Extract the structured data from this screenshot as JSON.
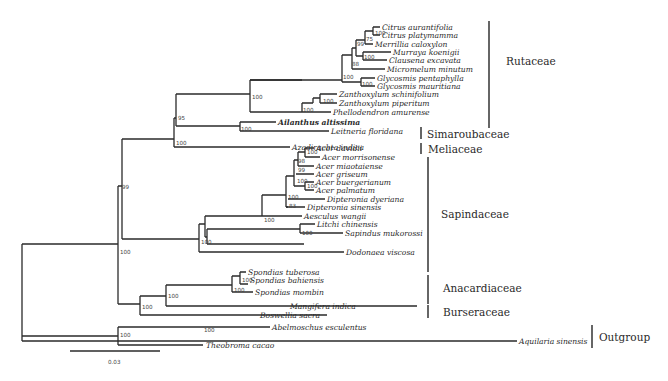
{
  "figure": {
    "type": "phylogenetic-tree",
    "scale_bar": {
      "label": "0.03"
    }
  },
  "taxa": [
    {
      "name": "Citrus aurantifolia",
      "y": 27,
      "x": 382
    },
    {
      "name": "Citrus platymamma",
      "y": 35,
      "x": 382
    },
    {
      "name": "Merrillia caloxylon",
      "y": 44,
      "x": 375
    },
    {
      "name": "Murraya koenigii",
      "y": 52,
      "x": 393
    },
    {
      "name": "Clausena excavata",
      "y": 60,
      "x": 389
    },
    {
      "name": "Micromelum minutum",
      "y": 69,
      "x": 387
    },
    {
      "name": "Glycosmis pentaphylla",
      "y": 78,
      "x": 377
    },
    {
      "name": "Glycosmis mauritiana",
      "y": 86,
      "x": 377
    },
    {
      "name": "Zanthoxylum schinifolium",
      "y": 94,
      "x": 339
    },
    {
      "name": "Zanthoxylum piperitum",
      "y": 103,
      "x": 339
    },
    {
      "name": "Phellodendron amurense",
      "y": 112,
      "x": 333
    },
    {
      "name": "Ailanthus altissima",
      "y": 122,
      "x": 278,
      "bold": true
    },
    {
      "name": "Leitneria floridana",
      "y": 131,
      "x": 331
    },
    {
      "name": "Azadirachta indica",
      "y": 140,
      "x": 293
    },
    {
      "name": "Acer davidii",
      "y": 148,
      "x": 316
    },
    {
      "name": "Acer morrisonense",
      "y": 157,
      "x": 322
    },
    {
      "name": "Acer miaotaiense",
      "y": 166,
      "x": 316
    },
    {
      "name": "Acer griseum",
      "y": 174,
      "x": 316
    },
    {
      "name": "Acer buergerianum",
      "y": 182,
      "x": 316
    },
    {
      "name": "Acer palmatum",
      "y": 190,
      "x": 316
    },
    {
      "name": "Dipteronia dyeriana",
      "y": 199,
      "x": 327
    },
    {
      "name": "Dipteronia sinensis",
      "y": 207,
      "x": 307
    },
    {
      "name": "Aesculus wangii",
      "y": 216,
      "x": 304
    },
    {
      "name": "Litchi chinensis",
      "y": 224,
      "x": 317
    },
    {
      "name": "Sapindus mukorossi",
      "y": 233,
      "x": 345
    },
    {
      "name": "Dodonaea viscosa",
      "y": 241,
      "x": 346
    },
    {
      "name": "Spondias tuberosa",
      "y": 250,
      "x": 239
    },
    {
      "name": "Spondias bahiensis",
      "y": 258,
      "x": 243
    },
    {
      "name": "Spondias mombin",
      "y": 266,
      "x": 248
    },
    {
      "name": "Mangifera indica",
      "y": 275,
      "x": 291
    },
    {
      "name": "Boswellia sacra",
      "y": 284,
      "x": 260
    },
    {
      "name": "Abelmoschus esculentus",
      "y": 292,
      "x": 303
    },
    {
      "name": "Theobroma cacao",
      "y": 301,
      "x": 240
    },
    {
      "name": "Aquilaria sinensis",
      "y": 312,
      "x": 519
    }
  ],
  "support_values": [
    {
      "label": "100",
      "x": 368,
      "y": 34
    },
    {
      "label": "75",
      "x": 367,
      "y": 42
    },
    {
      "name": "n99",
      "label": "99",
      "x": 355,
      "y": 49
    },
    {
      "label": "100",
      "x": 365,
      "y": 59
    },
    {
      "label": "88",
      "x": 355,
      "y": 66
    },
    {
      "label": "100",
      "x": 366,
      "y": 85
    },
    {
      "label": "100",
      "x": 343,
      "y": 75
    },
    {
      "label": "100",
      "x": 314,
      "y": 101
    },
    {
      "label": "100",
      "x": 303,
      "y": 110
    },
    {
      "label": "100",
      "x": 252,
      "y": 93
    },
    {
      "label": "95",
      "x": 174,
      "y": 116
    },
    {
      "label": "100",
      "x": 241,
      "y": 127
    },
    {
      "label": "100",
      "x": 174,
      "y": 140
    },
    {
      "label": "100",
      "x": 305,
      "y": 153
    },
    {
      "label": "98",
      "x": 296,
      "y": 162
    },
    {
      "label": "99",
      "x": 296,
      "y": 171
    },
    {
      "label": "100",
      "x": 297,
      "y": 180
    },
    {
      "label": "100",
      "x": 308,
      "y": 185
    },
    {
      "label": "100",
      "x": 286,
      "y": 194
    },
    {
      "label": "83",
      "x": 288,
      "y": 206
    },
    {
      "label": "100",
      "x": 263,
      "y": 210
    },
    {
      "label": "100",
      "x": 201,
      "y": 224
    },
    {
      "label": "100",
      "x": 300,
      "y": 231
    },
    {
      "label": "100",
      "x": 207,
      "y": 240
    },
    {
      "label": "99",
      "x": 123,
      "y": 189
    },
    {
      "label": "100",
      "x": 120,
      "y": 252
    },
    {
      "label": "100",
      "x": 249,
      "y": 254
    },
    {
      "label": "100",
      "x": 232,
      "y": 266
    },
    {
      "label": "100",
      "x": 168,
      "y": 268
    },
    {
      "label": "100",
      "x": 142,
      "y": 297
    },
    {
      "label": "100",
      "x": 121,
      "y": 336
    },
    {
      "label": "100",
      "x": 203,
      "y": 298
    }
  ],
  "families": [
    {
      "name": "Rutaceae",
      "label_x": 506,
      "label_y": 62,
      "line_x": 489,
      "y1": 21,
      "y2": 128
    },
    {
      "name": "Simaroubaceae",
      "label_x": 426,
      "label_y": 137,
      "line_x": 421,
      "y1": 127,
      "y2": 140
    },
    {
      "name": "Meliaceae",
      "label_x": 428,
      "label_y": 152,
      "line_x": 421,
      "y1": 143,
      "y2": 154
    },
    {
      "name": "Sapindaceae",
      "label_x": 441,
      "label_y": 216,
      "line_x": 428,
      "y1": 157,
      "y2": 272
    },
    {
      "name": "Anacardiaceae",
      "label_x": 443,
      "label_y": 292,
      "line_x": 428,
      "y1": 275,
      "y2": 304
    },
    {
      "name": "Burseraceae",
      "label_x": 443,
      "label_y": 316,
      "line_x": 428,
      "y1": 305,
      "y2": 318
    },
    {
      "name": "Outgroup",
      "label_x": 599,
      "label_y": 338,
      "line_x": 592,
      "y1": 323,
      "y2": 346
    }
  ]
}
